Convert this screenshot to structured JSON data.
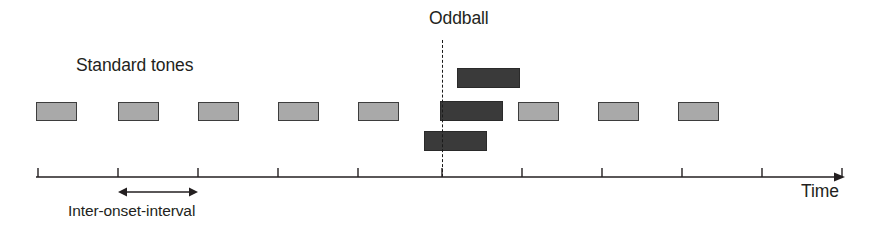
{
  "figure": {
    "background_color": "#ffffff"
  },
  "labels": {
    "standard_tones": "Standard tones",
    "oddball": "Oddball",
    "time_axis": "Time",
    "inter_onset_interval": "Inter-onset-interval"
  },
  "colors": {
    "standard_tone_fill": "#a9a9a9",
    "standard_tone_stroke": "#3d3d3d",
    "oddball_tone_fill": "#3a3a3a",
    "oddball_tone_stroke": "#2a2a2a",
    "axis": "#231f20",
    "marker_line": "#1a1a1a",
    "text": "#231f20"
  },
  "chart_data": {
    "type": "timeline",
    "xlabel": "Time",
    "ylabel": "",
    "grid": false,
    "legend": "none",
    "axis": {
      "line_y": 177,
      "x_start": 36,
      "x_end": 845,
      "arrow_head": true,
      "tick_height": 9,
      "tick_direction": "up",
      "tick_positions": [
        38,
        118,
        198,
        278,
        358,
        442,
        522,
        602,
        682,
        762,
        842
      ],
      "tick_labels": []
    },
    "annotations": [
      {
        "name": "standard-tones-label",
        "text": "Standard tones",
        "x": 76,
        "y": 57
      },
      {
        "name": "oddball-label",
        "text": "Oddball",
        "x": 429,
        "y": 10
      },
      {
        "name": "time-label",
        "text": "Time",
        "x": 801,
        "y": 183
      },
      {
        "name": "inter-onset-interval-label",
        "text": "Inter-onset-interval",
        "x": 68,
        "y": 203
      }
    ],
    "marker": {
      "name": "oddball-marker",
      "label": "Oddball",
      "x": 442,
      "y_top": 40,
      "y_bottom": 177,
      "style": "dashed"
    },
    "ioi_indicator": {
      "label": "Inter-onset-interval",
      "x_start": 118,
      "x_end": 198,
      "y": 192,
      "arrow_heads": "both",
      "value": 80
    },
    "series": [
      {
        "name": "Standard tones",
        "kind": "standard",
        "fill": "#a9a9a9",
        "events": [
          {
            "x": 36,
            "y": 102,
            "width": 41,
            "height": 19
          },
          {
            "x": 118,
            "y": 102,
            "width": 41,
            "height": 19
          },
          {
            "x": 198,
            "y": 102,
            "width": 41,
            "height": 19
          },
          {
            "x": 278,
            "y": 102,
            "width": 41,
            "height": 19
          },
          {
            "x": 358,
            "y": 102,
            "width": 41,
            "height": 19
          },
          {
            "x": 518,
            "y": 102,
            "width": 41,
            "height": 19
          },
          {
            "x": 598,
            "y": 102,
            "width": 41,
            "height": 19
          },
          {
            "x": 678,
            "y": 102,
            "width": 41,
            "height": 19
          }
        ]
      },
      {
        "name": "Oddball",
        "kind": "oddball",
        "fill": "#3a3a3a",
        "events": [
          {
            "x": 457,
            "y": 68,
            "width": 63,
            "height": 20
          },
          {
            "x": 440,
            "y": 101,
            "width": 63,
            "height": 20
          },
          {
            "x": 424,
            "y": 131,
            "width": 63,
            "height": 20
          }
        ]
      }
    ]
  }
}
